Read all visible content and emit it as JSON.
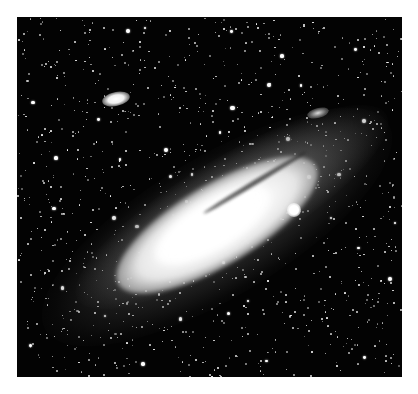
{
  "photo": {
    "subject": "Spiral galaxy with two satellite galaxies on a dense starfield",
    "background_color": "#030303",
    "page_color": "#ffffff",
    "star_count": 1100,
    "bright_star_count": 40
  },
  "objects": [
    {
      "name": "main-galaxy",
      "label": "",
      "x": 200,
      "y": 210,
      "angle": -31
    },
    {
      "name": "satellite-compact",
      "label": "",
      "x": 287,
      "y": 203
    },
    {
      "name": "satellite-elliptical",
      "label": "",
      "x": 115,
      "y": 99
    }
  ]
}
